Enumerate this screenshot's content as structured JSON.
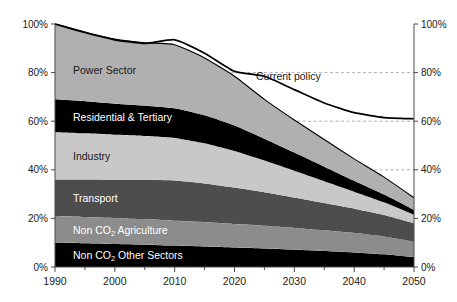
{
  "chart_data": {
    "type": "area",
    "stacked": true,
    "stack_mode": "percent",
    "title": "",
    "subtitle": "",
    "xlabel": "",
    "ylabel": "",
    "xlim": [
      1990,
      2050
    ],
    "ylim": [
      0,
      100
    ],
    "x": [
      1990,
      1995,
      2000,
      2005,
      2010,
      2015,
      2020,
      2025,
      2030,
      2035,
      2040,
      2045,
      2050
    ],
    "xticks": [
      1990,
      2000,
      2010,
      2020,
      2030,
      2040,
      2050
    ],
    "xtick_labels": [
      "1990",
      "2000",
      "2010",
      "2020",
      "2030",
      "2040",
      "2050"
    ],
    "xminorticks": [
      1995,
      2005,
      2015,
      2025,
      2035,
      2045
    ],
    "yticks": [
      0,
      20,
      40,
      60,
      80,
      100
    ],
    "ytick_labels": [
      "0%",
      "20%",
      "40%",
      "60%",
      "80%",
      "100%"
    ],
    "y_axis_right": true,
    "ytick_labels_right": [
      "0%",
      "20%",
      "40%",
      "60%",
      "80%",
      "100%"
    ],
    "grid": "dashed-horizontal-partial",
    "gridlines": [
      40,
      60,
      80
    ],
    "legend_position": "inline-on-bands",
    "series": [
      {
        "name": "Non CO2 Other Sectors",
        "label": "Non CO",
        "label_sub": "2",
        "label_tail": " Other Sectors",
        "color": "#000000",
        "text_color": "#ffffff",
        "values": [
          10.0,
          9.8,
          9.5,
          9.2,
          8.8,
          8.4,
          8.0,
          7.6,
          7.1,
          6.6,
          6.0,
          5.2,
          4.0
        ]
      },
      {
        "name": "Non CO2 Agriculture",
        "label": "Non CO",
        "label_sub": "2",
        "label_tail": " Agriculture",
        "color": "#8c8c8c",
        "text_color": "#ffffff",
        "values": [
          11.0,
          10.8,
          10.6,
          10.4,
          10.2,
          10.0,
          9.7,
          9.4,
          9.0,
          8.5,
          8.0,
          7.4,
          6.5
        ]
      },
      {
        "name": "Transport",
        "label": "Transport",
        "label_sub": "",
        "label_tail": "",
        "color": "#4d4d4d",
        "text_color": "#ffffff",
        "values": [
          15.0,
          15.4,
          15.8,
          16.3,
          16.6,
          16.0,
          15.0,
          13.8,
          12.5,
          11.2,
          10.0,
          8.8,
          7.5
        ]
      },
      {
        "name": "Industry",
        "label": "Industry",
        "label_sub": "",
        "label_tail": "",
        "color": "#c8c8c8",
        "text_color": "#1a1a1a",
        "values": [
          19.5,
          19.0,
          18.5,
          18.0,
          17.5,
          16.5,
          15.0,
          13.0,
          11.0,
          9.0,
          7.0,
          5.2,
          3.5
        ]
      },
      {
        "name": "Residential & Tertiary",
        "label": "Residential & Tertiary",
        "label_sub": "",
        "label_tail": "",
        "color": "#000000",
        "text_color": "#ffffff",
        "values": [
          13.5,
          13.2,
          12.8,
          12.5,
          12.2,
          11.5,
          10.5,
          9.0,
          7.5,
          6.0,
          4.5,
          3.2,
          2.0
        ]
      },
      {
        "name": "Power Sector",
        "label": "Power Sector",
        "label_sub": "",
        "label_tail": "",
        "color": "#b0b0b0",
        "text_color": "#1a1a1a",
        "values": [
          31.0,
          28.5,
          26.6,
          25.9,
          26.2,
          23.6,
          20.3,
          16.2,
          13.4,
          11.2,
          9.0,
          7.2,
          5.0
        ]
      }
    ],
    "stack_totals_top": [
      100.0,
      96.7,
      93.8,
      92.3,
      91.5,
      86.0,
      78.5,
      69.0,
      60.5,
      52.5,
      44.5,
      37.0,
      28.5
    ],
    "annotations": [
      {
        "name": "current-policy-line",
        "label": "Current policy",
        "type": "line",
        "color": "#000000",
        "label_x": 2029,
        "label_y": 77,
        "x": [
          1990,
          1995,
          2000,
          2005,
          2010,
          2015,
          2020,
          2025,
          2030,
          2035,
          2040,
          2045,
          2050
        ],
        "values": [
          100.0,
          96.5,
          93.5,
          92.0,
          93.5,
          88.0,
          80.5,
          78.5,
          73.0,
          67.5,
          63.5,
          61.5,
          61.0
        ]
      }
    ]
  },
  "labels": {
    "power_sector": "Power Sector",
    "residential_tertiary": "Residential & Tertiary",
    "industry": "Industry",
    "transport": "Transport",
    "non_co2_agriculture_pre": "Non CO",
    "non_co2_agriculture_sub": "2",
    "non_co2_agriculture_post": " Agriculture",
    "non_co2_other_pre": "Non CO",
    "non_co2_other_sub": "2",
    "non_co2_other_post": " Other Sectors",
    "current_policy": "Current policy"
  },
  "axes": {
    "y_left": [
      "100%",
      "80%",
      "60%",
      "40%",
      "20%",
      "0%"
    ],
    "y_right": [
      "100%",
      "80%",
      "60%",
      "40%",
      "20%",
      "0%"
    ],
    "x": [
      "1990",
      "2000",
      "2010",
      "2020",
      "2030",
      "2040",
      "2050"
    ]
  },
  "colors": {
    "power_sector": "#b0b0b0",
    "residential_tertiary": "#000000",
    "industry": "#c8c8c8",
    "transport": "#4d4d4d",
    "non_co2_agriculture": "#8c8c8c",
    "non_co2_other_sectors": "#000000",
    "axis": "#4a4a4a",
    "grid": "#9a9a9a",
    "text": "#1a1a1a",
    "background": "#ffffff"
  }
}
